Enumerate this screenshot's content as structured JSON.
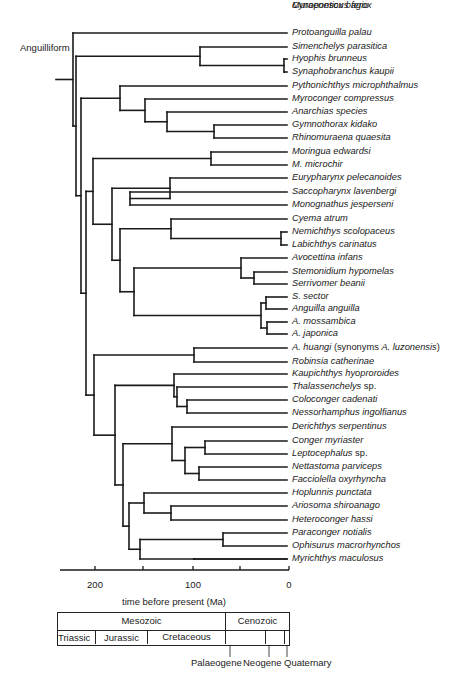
{
  "clade_label": "Anguilliform",
  "leaves": [
    {
      "name": "Protoanguilla palau"
    },
    {
      "name": "Simenchelys parasitica"
    },
    {
      "name": "Hyophis brunneus"
    },
    {
      "name": "Synaphobranchus kaupii"
    },
    {
      "name": "Pythonichthys microphthalmus"
    },
    {
      "name": "Myroconger compressus"
    },
    {
      "name": "Anarchias species"
    },
    {
      "name": "Gymnothorax kidako"
    },
    {
      "name": "Rhinomuraena quaesita"
    },
    {
      "name": "Moringua edwardsi"
    },
    {
      "name": "M. microchir"
    },
    {
      "name": "Eurypharynx pelecanoides"
    },
    {
      "name": "Saccopharynx lavenbergi"
    },
    {
      "name": "Monognathus jesperseni"
    },
    {
      "name": "Cyema atrum"
    },
    {
      "name": "Nemichthys scolopaceus"
    },
    {
      "name": "Labichthys carinatus"
    },
    {
      "name": "Avocettina infans"
    },
    {
      "name": "Stemonidium hypomelas"
    },
    {
      "name": "Serrivomer beanii"
    },
    {
      "name": "S. sector"
    },
    {
      "name": "Anguilla anguilla"
    },
    {
      "name": "A. mossambica"
    },
    {
      "name": "A. japonica"
    },
    {
      "name": "A. huangi",
      "note_prefix": " (synonyms ",
      "note_italic": "A. luzonensis",
      "note_suffix": ")"
    },
    {
      "name": "Robinsia catherinae"
    },
    {
      "name": "Kaupichthys hyoproroides"
    },
    {
      "name": "Thalassenchelys",
      "suffix": " sp."
    },
    {
      "name": "Coloconger cadenati"
    },
    {
      "name": "Nessorhamphus ingolfianus"
    },
    {
      "name": "Derichthys serpentinus"
    },
    {
      "name": "Conger myriaster"
    },
    {
      "name": "Leptocephalus",
      "suffix": " sp."
    },
    {
      "name": "Nettastoma parviceps"
    },
    {
      "name": "Facciolella oxyrhyncha"
    },
    {
      "name": "Hoplunnis punctata"
    },
    {
      "name": "Ariosoma shiroanago"
    },
    {
      "name": "Heteroconger hassi"
    },
    {
      "name": "Paraconger notialis"
    },
    {
      "name": "Ophisurus macrorhynchos"
    },
    {
      "name": "Myrichthys maculosus"
    },
    {
      "name": "Muraenesox bagio"
    },
    {
      "name": "Cynoponticus ferox"
    }
  ],
  "axis": {
    "title": "time before present (Ma)",
    "ticks": [
      {
        "value": 200,
        "label": "200"
      },
      {
        "value": 100,
        "label": "100"
      },
      {
        "value": 0,
        "label": "0"
      }
    ],
    "minor_ticks": [
      150,
      50
    ]
  },
  "timescale": {
    "eras": [
      {
        "name": "Mesozoic",
        "start": 235,
        "end": 66
      },
      {
        "name": "Cenozoic",
        "start": 66,
        "end": 0
      }
    ],
    "periods": [
      {
        "name": "Triassic",
        "start": 235,
        "end": 201
      },
      {
        "name": "Jurassic",
        "start": 201,
        "end": 145
      },
      {
        "name": "Cretaceous",
        "start": 145,
        "end": 66
      },
      {
        "name": "Palaeogene",
        "start": 66,
        "end": 23
      },
      {
        "name": "Neogene",
        "start": 23,
        "end": 2.6
      },
      {
        "name": "Quaternary",
        "start": 2.6,
        "end": 0
      }
    ],
    "callouts": [
      "Palaeogene",
      "Neogene",
      "Quaternary"
    ]
  },
  "colors": {
    "line": "#1a1a1a",
    "background": "#ffffff"
  }
}
